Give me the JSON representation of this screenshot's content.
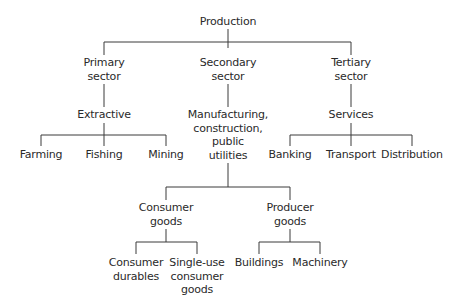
{
  "diagram": {
    "type": "tree",
    "root": {
      "label": "Production",
      "children": [
        {
          "label": "Primary sector",
          "lines": [
            "Primary",
            "sector"
          ],
          "children": [
            {
              "label": "Extractive",
              "children": [
                {
                  "label": "Farming"
                },
                {
                  "label": "Fishing"
                },
                {
                  "label": "Mining"
                }
              ]
            }
          ]
        },
        {
          "label": "Secondary sector",
          "lines": [
            "Secondary",
            "sector"
          ],
          "children": [
            {
              "label": "Manufacturing, construction, public utilities",
              "lines": [
                "Manufacturing,",
                "construction,",
                "public",
                "utilities"
              ],
              "children": [
                {
                  "label": "Consumer goods",
                  "lines": [
                    "Consumer",
                    "goods"
                  ],
                  "children": [
                    {
                      "label": "Consumer durables",
                      "lines": [
                        "Consumer",
                        "durables"
                      ]
                    },
                    {
                      "label": "Single-use consumer goods",
                      "lines": [
                        "Single-use",
                        "consumer",
                        "goods"
                      ]
                    }
                  ]
                },
                {
                  "label": "Producer goods",
                  "lines": [
                    "Producer",
                    "goods"
                  ],
                  "children": [
                    {
                      "label": "Buildings"
                    },
                    {
                      "label": "Machinery"
                    }
                  ]
                }
              ]
            }
          ]
        },
        {
          "label": "Tertiary sector",
          "lines": [
            "Tertiary",
            "sector"
          ],
          "children": [
            {
              "label": "Services",
              "children": [
                {
                  "label": "Banking"
                },
                {
                  "label": "Transport"
                },
                {
                  "label": "Distribution"
                }
              ]
            }
          ]
        }
      ]
    }
  },
  "labels": {
    "production": "Production",
    "primary": [
      "Primary",
      "sector"
    ],
    "secondary": [
      "Secondary",
      "sector"
    ],
    "tertiary": [
      "Tertiary",
      "sector"
    ],
    "extractive": "Extractive",
    "manufacturing": [
      "Manufacturing,",
      "construction,",
      "public",
      "utilities"
    ],
    "services": "Services",
    "farming": "Farming",
    "fishing": "Fishing",
    "mining": "Mining",
    "banking": "Banking",
    "transport": "Transport",
    "distribution": "Distribution",
    "consumer_goods": [
      "Consumer",
      "goods"
    ],
    "producer_goods": [
      "Producer",
      "goods"
    ],
    "consumer_durables": [
      "Consumer",
      "durables"
    ],
    "single_use": [
      "Single-use",
      "consumer",
      "goods"
    ],
    "buildings": "Buildings",
    "machinery": "Machinery"
  },
  "colors": {
    "line": "#3a3a3a",
    "text": "#2a2a2a",
    "background": "#ffffff"
  }
}
